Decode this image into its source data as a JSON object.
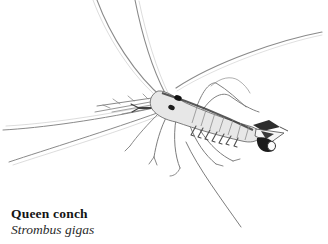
{
  "page": {
    "background": "#ffffff"
  },
  "figure": {
    "ink_color": "#8a8a8a",
    "dark_ink_color": "#3b3b3b",
    "accent_dark": "#111111",
    "body_fill": "#e7e7e7"
  },
  "caption": {
    "common_name": "Queen conch",
    "scientific_name": "Strombus gigas"
  }
}
